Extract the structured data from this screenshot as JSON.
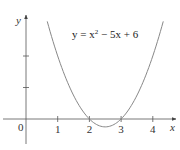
{
  "chart_data": {
    "type": "line",
    "title": "",
    "annotation": {
      "prefix": "y = x",
      "superscript": "2",
      "suffix": " − 5x + 6"
    },
    "function": "y = x^2 - 5x + 6",
    "coefficients": {
      "a": 1,
      "b": -5,
      "c": 6
    },
    "xlabel": "x",
    "ylabel": "y",
    "origin_label": "0",
    "xticks": [
      1,
      2,
      3,
      4
    ],
    "xtick_labels": [
      "1",
      "2",
      "3",
      "4"
    ],
    "yticks": [
      1,
      2
    ],
    "xlim": [
      -0.8,
      4.8
    ],
    "ylim": [
      -0.9,
      3.4
    ],
    "curve_x_range": [
      0.67,
      4.33
    ],
    "roots": [
      2,
      3
    ],
    "vertex": [
      2.5,
      -0.25
    ],
    "grid": false,
    "colors": {
      "curve": "#888888",
      "axes": "#555555",
      "text": "#333333"
    }
  }
}
